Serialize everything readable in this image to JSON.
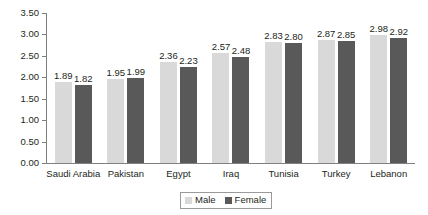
{
  "chart_data": {
    "type": "bar",
    "title": "",
    "subtitle": "",
    "xlabel": "",
    "ylabel": "",
    "categories": [
      "Saudi Arabia",
      "Pakistan",
      "Egypt",
      "Iraq",
      "Tunisia",
      "Turkey",
      "Lebanon"
    ],
    "series": [
      {
        "name": "Male",
        "color": "#d9d9d9",
        "values": [
          1.89,
          1.95,
          2.36,
          2.57,
          2.83,
          2.87,
          2.98
        ],
        "labels": [
          "1.89",
          "1.95",
          "2.36",
          "2.57",
          "2.83",
          "2.87",
          "2.98"
        ]
      },
      {
        "name": "Female",
        "color": "#595959",
        "values": [
          1.82,
          1.99,
          2.23,
          2.48,
          2.8,
          2.85,
          2.92
        ],
        "labels": [
          "1.82",
          "1.99",
          "2.23",
          "2.48",
          "2.80",
          "2.85",
          "2.92"
        ]
      }
    ],
    "ylim": [
      0.0,
      3.5
    ],
    "ytick_step": 0.5,
    "ytick_labels": [
      "0.00",
      "0.50",
      "1.00",
      "1.50",
      "2.00",
      "2.50",
      "3.00",
      "3.50"
    ],
    "ytick_values": [
      0.0,
      0.5,
      1.0,
      1.5,
      2.0,
      2.5,
      3.0,
      3.5
    ],
    "grid": false,
    "legend_position": "bottom-center",
    "data_labels_shown": true
  },
  "axis": {
    "y_labels": [
      "3.50",
      "3.00",
      "2.50",
      "2.00",
      "1.50",
      "1.00",
      "0.50",
      "0.00"
    ]
  },
  "legend": {
    "items": [
      {
        "label": "Male",
        "color": "#d9d9d9"
      },
      {
        "label": "Female",
        "color": "#595959"
      }
    ]
  },
  "colors": {
    "male": "#d9d9d9",
    "female": "#595959",
    "axis": "#808080",
    "text": "#231f20",
    "background": "#ffffff"
  }
}
